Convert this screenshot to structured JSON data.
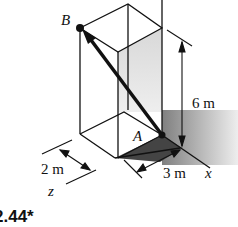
{
  "figure": {
    "number": "2.44*",
    "points": {
      "B": "B",
      "A": "A"
    },
    "axes": {
      "x": "x",
      "z": "z"
    },
    "dimensions": {
      "height": "6 m",
      "depth": "2 m",
      "width": "3 m"
    }
  }
}
